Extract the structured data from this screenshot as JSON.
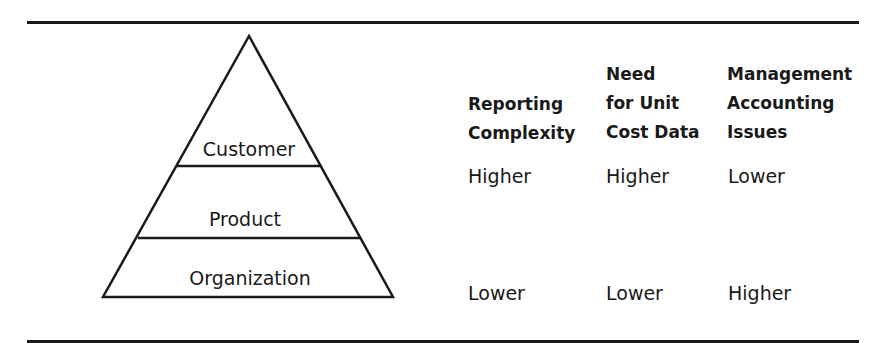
{
  "pyramid": {
    "levels": [
      {
        "label": "Customer"
      },
      {
        "label": "Product"
      },
      {
        "label": "Organization"
      }
    ]
  },
  "table": {
    "columns": [
      {
        "header_lines": [
          "Reporting",
          "Complexity"
        ],
        "top": "Higher",
        "bottom": "Lower"
      },
      {
        "header_lines": [
          "Need",
          "for Unit",
          "Cost Data"
        ],
        "top": "Higher",
        "bottom": "Lower"
      },
      {
        "header_lines": [
          "Management",
          "Accounting",
          "Issues"
        ],
        "top": "Lower",
        "bottom": "Higher"
      }
    ]
  },
  "colors": {
    "ink": "#1a1a1a",
    "background": "#ffffff"
  }
}
